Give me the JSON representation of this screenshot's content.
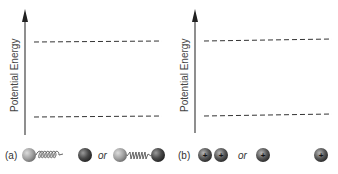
{
  "panels": [
    {
      "id": "a",
      "label": "(a)",
      "axis_label": "Potential Energy",
      "dashed_levels": [
        "upper",
        "lower"
      ],
      "system": "spring-connected two atoms",
      "states": [
        {
          "description": "stretched spring",
          "or_label": "or"
        },
        {
          "description": "compressed spring"
        }
      ]
    },
    {
      "id": "b",
      "label": "(b)",
      "axis_label": "Potential Energy",
      "dashed_levels": [
        "upper",
        "lower"
      ],
      "system": "two positive charges",
      "states": [
        {
          "description": "charges close together",
          "or_label": "or"
        },
        {
          "description": "charges far apart"
        }
      ],
      "charge_symbol": "+"
    }
  ],
  "colors": {
    "axis": "#333333",
    "dash": "#333333",
    "light_sphere": "#a8a8a8",
    "dark_sphere": "#4a4a4a",
    "spring": "#555555"
  }
}
